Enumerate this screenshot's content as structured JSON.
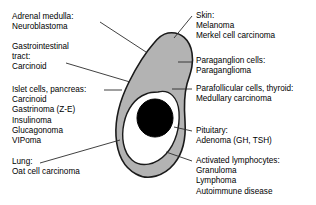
{
  "diagram": {
    "colors": {
      "cytoplasm_gray": "#b3b3b3",
      "inner_white": "#ffffff",
      "nucleus_black": "#000000",
      "outline": "#1a1a1a",
      "leader_line": "#2b2b2b",
      "text": "#000000",
      "background": "#ffffff"
    },
    "cell": {
      "outer_name": "cell-cytoplasm",
      "inner_name": "cell-inner-region",
      "nucleus_name": "cell-nucleus"
    },
    "labels": {
      "left": [
        {
          "id": "adrenal-medulla",
          "lines": [
            "Adrenal medulla:",
            "Neuroblastoma"
          ]
        },
        {
          "id": "gastrointestinal-tract",
          "lines": [
            "Gastrointestinal",
            "tract:",
            "Carcinoid"
          ]
        },
        {
          "id": "islet-cells-pancreas",
          "lines": [
            "Islet cells, pancreas:",
            "Carcinoid",
            "Gastrinoma (Z-E)",
            "Insulinoma",
            "Glucagonoma",
            "VIPoma"
          ]
        },
        {
          "id": "lung",
          "lines": [
            "Lung:",
            "Oat cell carcinoma"
          ]
        }
      ],
      "right": [
        {
          "id": "skin",
          "lines": [
            "Skin:",
            "Melanoma",
            "Merkel cell carcinoma"
          ]
        },
        {
          "id": "paraganglion-cells",
          "lines": [
            "Paraganglion cells:",
            "Paraganglioma"
          ]
        },
        {
          "id": "parafollicular-cells-thyroid",
          "lines": [
            "Parafollicular cells, thyroid:",
            "Medullary carcinoma"
          ]
        },
        {
          "id": "pituitary",
          "lines": [
            "Pituitary:",
            "Adenoma (GH, TSH)"
          ]
        },
        {
          "id": "activated-lymphocytes",
          "lines": [
            "Activated lymphocytes:",
            "Granuloma",
            "Lymphoma",
            "Autoimmune disease"
          ]
        }
      ]
    }
  }
}
